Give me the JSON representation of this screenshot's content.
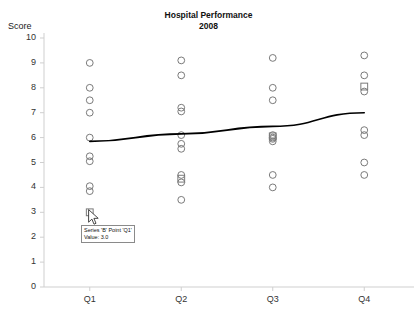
{
  "chart_data": {
    "type": "scatter",
    "title": "Hospital Performance",
    "subtitle": "2008",
    "ylabel": "Score",
    "xlabel": "",
    "categories": [
      "Q1",
      "Q2",
      "Q3",
      "Q4"
    ],
    "ylim": [
      0,
      10
    ],
    "yticks": [
      0,
      1,
      2,
      3,
      4,
      5,
      6,
      7,
      8,
      9,
      10
    ],
    "grid": false,
    "legend": "none",
    "marker_shape_default": "circle-open",
    "series": [
      {
        "name": "A",
        "marker": "circle-open",
        "points": [
          {
            "x": "Q1",
            "values": [
              9.0,
              8.0,
              7.5,
              7.0,
              6.0,
              5.25,
              5.05,
              4.05,
              3.85
            ]
          },
          {
            "x": "Q2",
            "values": [
              9.1,
              8.5,
              7.2,
              7.05,
              6.1,
              5.75,
              5.55,
              4.5,
              4.2,
              3.5
            ]
          },
          {
            "x": "Q3",
            "values": [
              9.2,
              8.0,
              7.5,
              6.1,
              6.0,
              5.95,
              5.85,
              4.5,
              4.0
            ]
          },
          {
            "x": "Q4",
            "values": [
              9.3,
              8.5,
              7.85,
              6.3,
              6.1,
              5.0,
              4.5
            ]
          }
        ]
      },
      {
        "name": "B",
        "marker": "square-open",
        "points": [
          {
            "x": "Q1",
            "values": [
              3.0
            ]
          },
          {
            "x": "Q2",
            "values": [
              4.35
            ]
          },
          {
            "x": "Q3",
            "values": [
              6.05
            ]
          },
          {
            "x": "Q4",
            "values": [
              8.05
            ]
          }
        ]
      }
    ],
    "trendline": {
      "name": "trend",
      "color": "#000000",
      "points": [
        {
          "x": "Q1",
          "y": 5.85
        },
        {
          "x": "Q2",
          "y": 6.15
        },
        {
          "x": "Q3",
          "y": 6.45
        },
        {
          "x": "Q4",
          "y": 7.0
        }
      ]
    }
  },
  "tooltip": {
    "line1": "Series 'B' Point 'Q1'",
    "line2": "Value: 3.0"
  },
  "colors": {
    "axis": "#cfcfcf",
    "marker_stroke": "#7a7a7a",
    "line": "#000000",
    "text": "#1a1a1a",
    "tooltip_border": "#8a8a8a",
    "tooltip_bg": "#ffffff"
  }
}
